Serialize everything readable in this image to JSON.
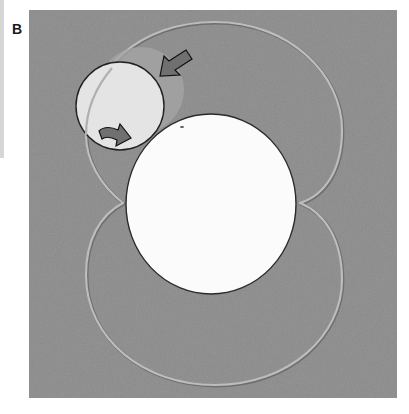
{
  "figure": {
    "panel_label": "B",
    "colors": {
      "page_background": "#ffffff",
      "panel_background": "#8b8b8b",
      "orbit_path": "#b9b9b9",
      "orbit_path_shadow": "#6f6f6f",
      "large_disk_fill": "#fbfbfb",
      "large_disk_outline": "#2a2a2a",
      "small_disk_fill": "#e4e4e4",
      "small_disk_outline": "#222222",
      "ghost_disk_fill": "#a6a6a6",
      "arrow_fill": "#707070",
      "arrow_outline": "#111111"
    },
    "elements": {
      "panel": {
        "x": 29,
        "y": 10,
        "width": 368,
        "height": 388
      },
      "large_disk": {
        "cx": 211,
        "cy": 204,
        "rx": 85,
        "ry": 90
      },
      "small_disk": {
        "cx": 120,
        "cy": 106,
        "r": 44
      },
      "ghost_disk": {
        "cx": 141,
        "cy": 90,
        "r": 43
      },
      "orbit_upper_loop": {
        "top_y": 21,
        "left_x": 84,
        "right_x": 342,
        "pinch_left": [
          123,
          203
        ],
        "pinch_right": [
          300,
          203
        ]
      },
      "orbit_lower_loop": {
        "bottom_y": 385,
        "left_x": 85,
        "right_x": 342
      },
      "arrow_upper": {
        "direction": "down-left",
        "tip": [
          160,
          75
        ],
        "tail": [
          190,
          55
        ]
      },
      "arrow_lower": {
        "direction": "right",
        "tip": [
          131,
          140
        ],
        "tail": [
          99,
          133
        ]
      }
    }
  }
}
